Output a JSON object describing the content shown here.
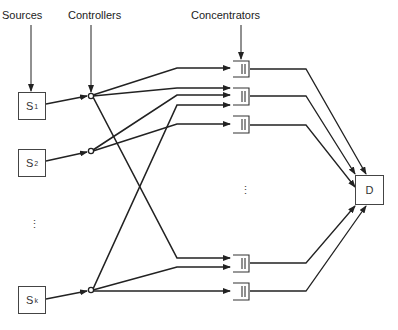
{
  "labels": {
    "sources": "Sources",
    "controllers": "Controllers",
    "concentrators": "Concentrators"
  },
  "sources": [
    {
      "main": "S",
      "sub": "1"
    },
    {
      "main": "S",
      "sub": "2"
    },
    {
      "main": "S",
      "sub": "k"
    }
  ],
  "destination": {
    "label": "D"
  },
  "ellipsis": {
    "sources": "⋮",
    "concentrators": "⋮"
  },
  "colors": {
    "line": "#222222",
    "box_border": "#444444"
  }
}
